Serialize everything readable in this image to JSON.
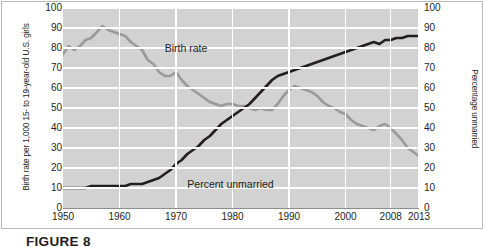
{
  "figure": {
    "caption_label": "FIGURE",
    "caption_number": "8"
  },
  "chart_data": {
    "type": "line",
    "title": "",
    "xlabel": "",
    "ylabel": "Birth rate per 1,000 15- to 19-year-old U.S. girls",
    "ylabel_right": "Percentage unmarried",
    "ylim": [
      0,
      100
    ],
    "xlim": [
      1950,
      2013
    ],
    "grid": true,
    "legend_position": "inline-annotations",
    "yticks": [
      0,
      10,
      20,
      30,
      40,
      50,
      60,
      70,
      80,
      90,
      100
    ],
    "yticks_right": [
      0,
      10,
      20,
      30,
      40,
      50,
      60,
      70,
      80,
      90,
      100
    ],
    "xticks": [
      1950,
      1960,
      1970,
      1980,
      1990,
      2000,
      2008,
      2013
    ],
    "xtick_labels": [
      "1950",
      "1960",
      "1970",
      "1980",
      "1990",
      "2000",
      "2008",
      "2013"
    ],
    "annotations": [
      {
        "text": "Birth rate",
        "x": 1968,
        "y": 80
      },
      {
        "text": "Percent unmarried",
        "x": 1972,
        "y": 12
      }
    ],
    "series": [
      {
        "name": "Birth rate",
        "color": "#9a9a9a",
        "axis": "left",
        "x": [
          1950,
          1951,
          1952,
          1953,
          1954,
          1955,
          1956,
          1957,
          1958,
          1959,
          1960,
          1961,
          1962,
          1963,
          1964,
          1965,
          1966,
          1967,
          1968,
          1969,
          1970,
          1971,
          1972,
          1973,
          1974,
          1975,
          1976,
          1977,
          1978,
          1979,
          1980,
          1981,
          1982,
          1983,
          1984,
          1985,
          1986,
          1987,
          1988,
          1989,
          1990,
          1991,
          1992,
          1993,
          1994,
          1995,
          1996,
          1997,
          1998,
          1999,
          2000,
          2001,
          2002,
          2003,
          2004,
          2005,
          2006,
          2007,
          2008,
          2009,
          2010,
          2011,
          2012,
          2013
        ],
        "values": [
          77,
          81,
          79,
          81,
          84,
          85,
          88,
          91,
          89,
          88,
          87,
          86,
          83,
          81,
          79,
          74,
          72,
          68,
          66,
          66,
          68,
          64,
          61,
          59,
          57,
          55,
          53,
          52,
          51,
          52,
          52,
          51,
          51,
          50,
          49,
          50,
          49,
          49,
          52,
          56,
          59,
          61,
          60,
          59,
          58,
          56,
          53,
          51,
          50,
          48,
          47,
          44,
          42,
          41,
          40,
          39,
          41,
          42,
          40,
          37,
          34,
          30,
          28,
          26
        ]
      },
      {
        "name": "Percent unmarried",
        "color": "#231f20",
        "axis": "right",
        "x": [
          1950,
          1951,
          1952,
          1953,
          1954,
          1955,
          1956,
          1957,
          1958,
          1959,
          1960,
          1961,
          1962,
          1963,
          1964,
          1965,
          1966,
          1967,
          1968,
          1969,
          1970,
          1971,
          1972,
          1973,
          1974,
          1975,
          1976,
          1977,
          1978,
          1979,
          1980,
          1981,
          1982,
          1983,
          1984,
          1985,
          1986,
          1987,
          1988,
          1989,
          1990,
          1991,
          1992,
          1993,
          1994,
          1995,
          1996,
          1997,
          1998,
          1999,
          2000,
          2001,
          2002,
          2003,
          2004,
          2005,
          2006,
          2007,
          2008,
          2009,
          2010,
          2011,
          2012,
          2013
        ],
        "values": [
          10,
          10,
          10,
          10,
          10,
          11,
          11,
          11,
          11,
          11,
          11,
          11,
          12,
          12,
          12,
          13,
          14,
          15,
          17,
          19,
          22,
          24,
          27,
          29,
          31,
          34,
          36,
          39,
          42,
          44,
          46,
          48,
          50,
          52,
          55,
          58,
          61,
          64,
          66,
          67,
          68,
          69,
          70,
          71,
          72,
          73,
          74,
          75,
          76,
          77,
          78,
          79,
          80,
          81,
          82,
          83,
          82,
          84,
          84,
          85,
          85,
          86,
          86,
          86
        ]
      }
    ]
  }
}
